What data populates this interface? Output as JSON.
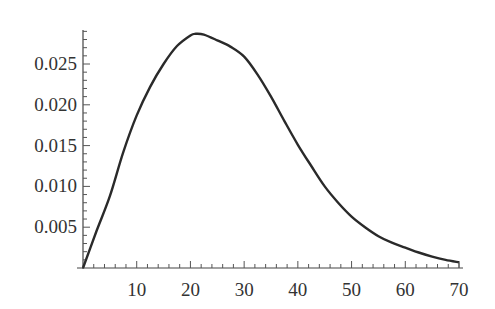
{
  "chart_data": {
    "type": "line",
    "title": "",
    "xlabel": "",
    "ylabel": "",
    "xlim": [
      0,
      70
    ],
    "ylim": [
      0,
      0.029
    ],
    "grid": false,
    "legend": null,
    "x_ticks": [
      10,
      20,
      30,
      40,
      50,
      60,
      70
    ],
    "x_tick_labels": [
      "10",
      "20",
      "30",
      "40",
      "50",
      "60",
      "70"
    ],
    "x_minor_step": 2,
    "y_ticks": [
      0.005,
      0.01,
      0.015,
      0.02,
      0.025
    ],
    "y_tick_labels": [
      "0.005",
      "0.010",
      "0.015",
      "0.020",
      "0.025"
    ],
    "y_minor_step": 0.001,
    "series": [
      {
        "name": "density",
        "color": "#2a2a2a",
        "x": [
          0,
          2.5,
          5,
          7.5,
          10,
          12.5,
          15,
          17.5,
          20,
          21,
          22.5,
          25,
          27.5,
          30,
          32.5,
          35,
          37.5,
          40,
          42.5,
          45,
          47.5,
          50,
          52.5,
          55,
          57.5,
          60,
          62.5,
          65,
          67.5,
          70
        ],
        "y": [
          0,
          0.0045,
          0.0088,
          0.0142,
          0.0187,
          0.0222,
          0.025,
          0.0272,
          0.0285,
          0.0287,
          0.0286,
          0.0279,
          0.0271,
          0.0259,
          0.0237,
          0.021,
          0.018,
          0.0151,
          0.0125,
          0.01,
          0.008,
          0.0063,
          0.005,
          0.0039,
          0.0031,
          0.0025,
          0.0019,
          0.0014,
          0.001,
          0.0007
        ]
      }
    ]
  }
}
